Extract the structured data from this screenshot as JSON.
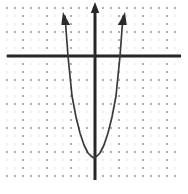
{
  "figure": {
    "kind": "coordinate-plane-graph",
    "width": 188,
    "height": 194,
    "background_color": "#ffffff"
  },
  "grid": {
    "style": "dotted",
    "minor_dot_color": "#d8d8d8",
    "major_dot_color": "#9a9a9a",
    "minor_spacing_px": 8,
    "major_spacing_px": 24,
    "left_px": 7,
    "right_px": 181,
    "top_px": 5,
    "bottom_px": 180,
    "dot_radius_px": 0.75,
    "major_dot_radius_px": 1.1
  },
  "axes": {
    "color": "#262626",
    "stroke_width_px": 3,
    "origin_x_px": 95,
    "origin_y_px": 56,
    "x_axis": {
      "label": "x-axis",
      "y_px": 56,
      "start_px": 7,
      "end_px": 181,
      "has_arrowheads": false
    },
    "y_axis": {
      "label": "y-axis",
      "x_px": 95,
      "start_px": 180,
      "end_px": 2,
      "has_arrowhead_top": true,
      "arrowhead_tip_y_px": 2
    }
  },
  "chart_data": {
    "type": "line",
    "title": "",
    "xlabel": "",
    "ylabel": "",
    "grid": true,
    "legend_position": "none",
    "curve_name": "parabola",
    "curve_color": "#3a3a3a",
    "curve_stroke_width_px": 1.7,
    "opens": "up",
    "vertex_px": [
      94,
      158
    ],
    "vertex_units": [
      0,
      -4.25
    ],
    "x_intercepts_px": [
      68,
      120
    ],
    "x_intercepts_units": [
      -1.12,
      1.04
    ],
    "pixels_per_unit_x": 24,
    "pixels_per_unit_y": 24,
    "equation_units": "y = 3.4 x^2 - 4.25",
    "a_px": 0.151,
    "branch_arrowheads": [
      {
        "name": "left-branch-arrowhead",
        "tip_px": [
          63,
          12
        ],
        "direction": "up-left"
      },
      {
        "name": "right-branch-arrowhead",
        "tip_px": [
          125,
          12
        ],
        "direction": "up-right"
      }
    ],
    "sample_points_px": [
      [
        65,
        16
      ],
      [
        68,
        56
      ],
      [
        72,
        96
      ],
      [
        76,
        117
      ],
      [
        80,
        133
      ],
      [
        84,
        145
      ],
      [
        88,
        153
      ],
      [
        91,
        156
      ],
      [
        94,
        158
      ],
      [
        97,
        156
      ],
      [
        100,
        153
      ],
      [
        104,
        145
      ],
      [
        108,
        133
      ],
      [
        112,
        117
      ],
      [
        116,
        96
      ],
      [
        120,
        56
      ],
      [
        123,
        16
      ]
    ],
    "series": [
      {
        "name": "parabola",
        "x": [
          -1.29,
          -1.12,
          -0.96,
          -0.79,
          -0.63,
          -0.46,
          -0.29,
          -0.17,
          0.0,
          0.13,
          0.21,
          0.38,
          0.54,
          0.71,
          0.88,
          1.04,
          1.17
        ],
        "y": [
          1.67,
          0.0,
          -1.67,
          -2.54,
          -3.21,
          -3.71,
          -4.04,
          -4.17,
          -4.25,
          -4.17,
          -4.04,
          -3.71,
          -3.21,
          -2.54,
          -1.67,
          0.0,
          1.67
        ]
      }
    ]
  }
}
